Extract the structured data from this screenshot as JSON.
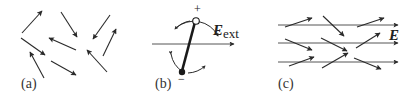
{
  "figure": {
    "panels": [
      {
        "id": "a",
        "label": "(a)",
        "description": "Randomly oriented dipoles",
        "arrows": [
          {
            "x1": 22,
            "y1": 33,
            "x2": 42,
            "y2": 11
          },
          {
            "x1": 61,
            "y1": 12,
            "x2": 77,
            "y2": 37
          },
          {
            "x1": 110,
            "y1": 15,
            "x2": 93,
            "y2": 39
          },
          {
            "x1": 21,
            "y1": 38,
            "x2": 45,
            "y2": 55
          },
          {
            "x1": 76,
            "y1": 50,
            "x2": 49,
            "y2": 38
          },
          {
            "x1": 103,
            "y1": 56,
            "x2": 116,
            "y2": 29
          },
          {
            "x1": 44,
            "y1": 78,
            "x2": 30,
            "y2": 52
          },
          {
            "x1": 51,
            "y1": 61,
            "x2": 76,
            "y2": 75
          },
          {
            "x1": 107,
            "y1": 72,
            "x2": 87,
            "y2": 50
          }
        ]
      },
      {
        "id": "b",
        "label": "(b)",
        "description": "Single dipole rotating in external field",
        "field_label": "E",
        "field_subscript": "ext",
        "plus_sign": "+",
        "minus_sign": "−"
      },
      {
        "id": "c",
        "label": "(c)",
        "description": "Dipoles partially aligned with field",
        "field_label": "E",
        "field_lines_y": [
          25,
          43,
          62
        ],
        "arrows": [
          {
            "x1": 285,
            "y1": 27,
            "x2": 312,
            "y2": 18
          },
          {
            "x1": 323,
            "y1": 16,
            "x2": 344,
            "y2": 36
          },
          {
            "x1": 357,
            "y1": 27,
            "x2": 384,
            "y2": 18
          },
          {
            "x1": 285,
            "y1": 39,
            "x2": 312,
            "y2": 50
          },
          {
            "x1": 321,
            "y1": 38,
            "x2": 347,
            "y2": 51
          },
          {
            "x1": 356,
            "y1": 48,
            "x2": 380,
            "y2": 33
          },
          {
            "x1": 289,
            "y1": 66,
            "x2": 314,
            "y2": 57
          },
          {
            "x1": 322,
            "y1": 68,
            "x2": 348,
            "y2": 53
          },
          {
            "x1": 354,
            "y1": 58,
            "x2": 381,
            "y2": 69
          }
        ]
      }
    ],
    "colors": {
      "stroke": "#2a2a2a",
      "field_line": "#555555",
      "background": "#ffffff"
    }
  }
}
